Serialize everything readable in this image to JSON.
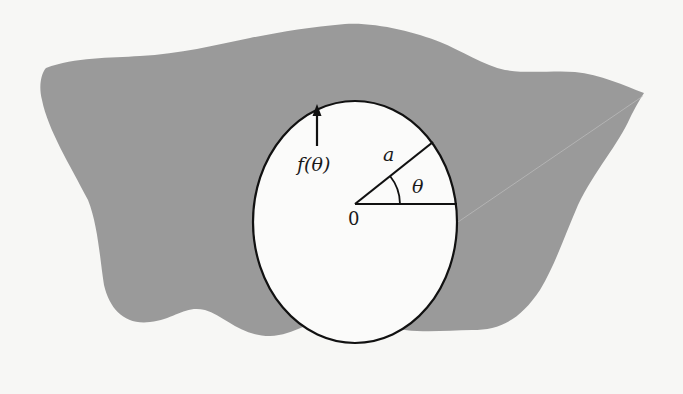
{
  "figure": {
    "colors": {
      "background": "#f7f7f5",
      "region_fill": "#9a9a9a",
      "hole_fill": "#fbfbfa",
      "stroke": "#111111"
    },
    "labels": {
      "radius": "a",
      "angle": "θ",
      "origin": "0",
      "boundary_function": "f(θ)"
    }
  }
}
